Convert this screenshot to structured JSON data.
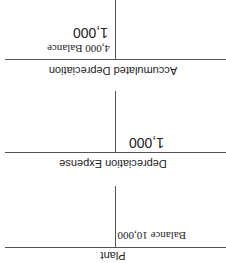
{
  "accounts": [
    {
      "title": "Plant",
      "debit": [
        {
          "label": "Balance",
          "value": "10,000"
        }
      ],
      "credit": []
    },
    {
      "title": "Depreciation Expense",
      "debit": [
        {
          "value": "1,000"
        }
      ],
      "credit": []
    },
    {
      "title": "Accumulated Depreciation",
      "debit": [],
      "credit": [
        {
          "value": "4,000",
          "label": "Balance"
        },
        {
          "value": "1,000"
        }
      ]
    }
  ]
}
